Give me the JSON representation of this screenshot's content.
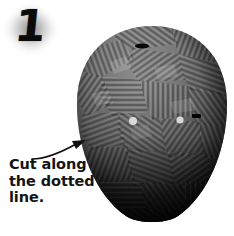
{
  "page": {
    "width": 234,
    "height": 236,
    "background_color": "#ffffff",
    "kind": "craft-instruction-step-illustration"
  },
  "badge": {
    "step_number": "1",
    "shape": "diamond-glow",
    "number_color": "#0b0b0b",
    "glow_color": "#9a9a9a"
  },
  "illustration": {
    "subject_name": "taped-mask-form",
    "description_alt": "Oval head form covered in crosshatched tape strips",
    "base_color": "#6d6d6d",
    "shadow_color": "#101010",
    "highlight_color": "#b9b9b9",
    "eye_holes": [
      {
        "name": "left-eye-hole",
        "cx": 59,
        "cy": 97,
        "r": 4.0,
        "color": "#ffffff"
      },
      {
        "name": "right-eye-hole",
        "cx": 106,
        "cy": 96,
        "r": 3.6,
        "color": "#ffffff"
      }
    ],
    "marks": [
      {
        "name": "top-dark-mark",
        "x": 68,
        "y": 22
      },
      {
        "name": "right-dark-mark",
        "x": 122,
        "y": 93
      }
    ]
  },
  "arrow": {
    "name": "curved-pointer-arrow",
    "color": "#111111",
    "direction": "up-right",
    "stroke_width": 1.6
  },
  "caption": {
    "color": "#141414",
    "lines": [
      "Cut along",
      "the dotted",
      "line."
    ],
    "full_text": "Cut along the dotted line."
  }
}
